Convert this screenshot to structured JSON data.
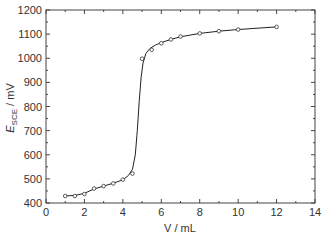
{
  "chart_data": {
    "type": "line",
    "title": "",
    "xlabel": "V / mL",
    "ylabel": "E_SCE / mV",
    "ylabel_main": "E",
    "ylabel_sub": "SCE",
    "ylabel_unit": " / mV",
    "xlim": [
      0,
      14
    ],
    "ylim": [
      400,
      1200
    ],
    "x_ticks": [
      0,
      2,
      4,
      6,
      8,
      10,
      12,
      14
    ],
    "y_ticks": [
      400,
      500,
      600,
      700,
      800,
      900,
      1000,
      1100,
      1200
    ],
    "grid": false,
    "legend": null,
    "series": [
      {
        "name": "measured",
        "marker": "open-circle",
        "x": [
          1,
          1.5,
          2,
          2.5,
          3,
          3.5,
          4,
          4.5,
          5,
          5.5,
          6,
          6.5,
          7,
          8,
          9,
          10,
          12
        ],
        "y": [
          429,
          429,
          437,
          460,
          470,
          481,
          497,
          522,
          998,
          1035,
          1062,
          1078,
          1090,
          1103,
          1112,
          1119,
          1130
        ]
      },
      {
        "name": "fitted curve",
        "marker": "none",
        "x": [
          1,
          1.5,
          2,
          2.5,
          3,
          3.5,
          4,
          4.3,
          4.5,
          4.65,
          4.75,
          4.85,
          4.95,
          5.05,
          5.2,
          5.4,
          5.7,
          6,
          6.5,
          7,
          8,
          9,
          10,
          12
        ],
        "y": [
          430,
          431,
          440,
          458,
          470,
          482,
          496,
          515,
          540,
          600,
          700,
          820,
          920,
          980,
          1020,
          1040,
          1055,
          1065,
          1078,
          1089,
          1103,
          1112,
          1119,
          1130
        ]
      }
    ]
  }
}
